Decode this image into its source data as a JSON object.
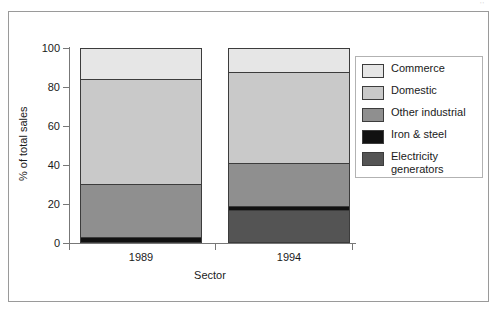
{
  "figure": {
    "corner_artifact": "''",
    "frame": true
  },
  "chart_data": {
    "type": "bar",
    "stacked": true,
    "title": "",
    "xlabel": "Sector",
    "ylabel": "% of total sales",
    "categories": [
      "1989",
      "1994"
    ],
    "ylim": [
      0,
      100
    ],
    "yticks": [
      0,
      20,
      40,
      60,
      80,
      100
    ],
    "ytick_labels": [
      "0",
      "20",
      "40",
      "60",
      "80",
      "100"
    ],
    "grid": false,
    "legend_position": "right",
    "series": [
      {
        "name": "Electricity generators",
        "color": "#545454",
        "values": [
          0,
          17
        ]
      },
      {
        "name": "Iron & steel",
        "color": "#111111",
        "values": [
          3,
          2
        ]
      },
      {
        "name": "Other industrial",
        "color": "#8f8f8f",
        "values": [
          27.5,
          22
        ]
      },
      {
        "name": "Domestic",
        "color": "#c9c9c9",
        "values": [
          53.5,
          46.5
        ]
      },
      {
        "name": "Commerce",
        "color": "#e6e6e6",
        "values": [
          16,
          12.5
        ]
      }
    ],
    "stack_order_top_to_bottom": [
      "Commerce",
      "Domestic",
      "Other industrial",
      "Iron & steel",
      "Electricity generators"
    ],
    "cumulative_tops": {
      "1989": {
        "Electricity generators": 0,
        "Iron & steel": 3,
        "Other industrial": 30.5,
        "Domestic": 84,
        "Commerce": 100
      },
      "1994": {
        "Electricity generators": 17,
        "Iron & steel": 19,
        "Other industrial": 41,
        "Domestic": 87.5,
        "Commerce": 100
      }
    }
  },
  "legend": {
    "items": [
      {
        "label": "Commerce",
        "color": "#e6e6e6"
      },
      {
        "label": "Domestic",
        "color": "#c9c9c9"
      },
      {
        "label": "Other industrial",
        "color": "#8f8f8f"
      },
      {
        "label": "Iron & steel",
        "color": "#111111"
      },
      {
        "label": "Electricity\ngenerators",
        "color": "#545454"
      }
    ]
  }
}
